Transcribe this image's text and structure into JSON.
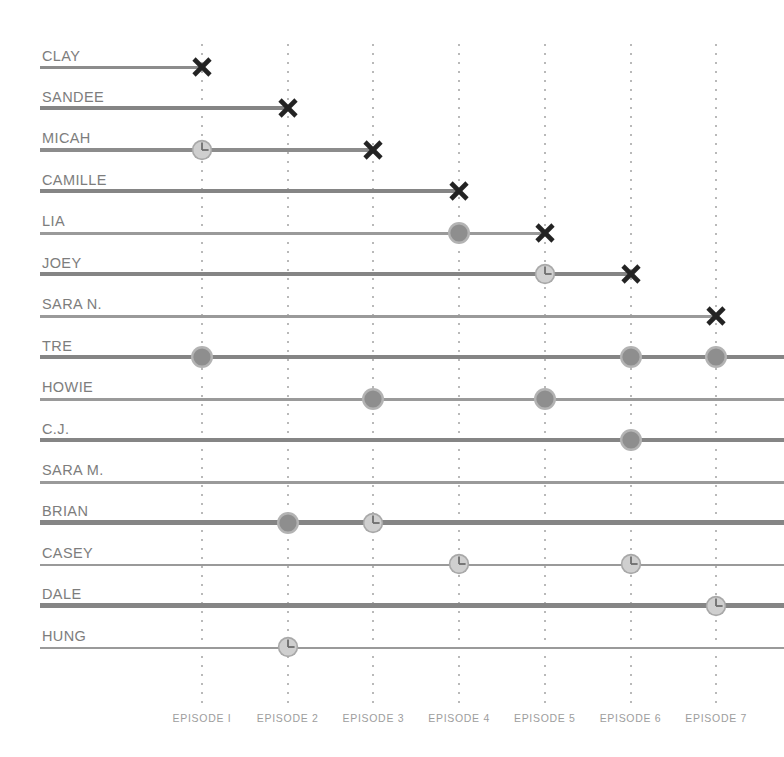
{
  "chart_data": {
    "type": "table",
    "title": "",
    "xlabel": "",
    "ylabel": "",
    "categories": [
      "EPISODE I",
      "EPISODE 2",
      "EPISODE 3",
      "EPISODE 4",
      "EPISODE 5",
      "EPISODE 6",
      "EPISODE 7"
    ],
    "legend": [],
    "grid": true,
    "marker_types": {
      "x": "eliminated-x-marker",
      "circle": "dark-circle-marker",
      "clock": "clock-circle-marker"
    },
    "colors": {
      "line": "#8c8c8c",
      "label": "#7d7d7d",
      "axis_label": "#9d9d9d",
      "gridline": "#b9b9b9",
      "marker_x": "#232323",
      "marker_circle_fill": "#8e8e8e",
      "marker_circle_ring": "#b3b3b3",
      "marker_clock_fill": "#cfcfcf",
      "marker_clock_ring": "#a8a8a8",
      "marker_clock_hands": "#6e6e6e"
    },
    "series": [
      {
        "name": "CLAY",
        "end_episode": 1,
        "line_weight": "med",
        "markers": [
          {
            "episode": 1,
            "type": "x"
          }
        ]
      },
      {
        "name": "SANDEE",
        "end_episode": 2,
        "line_weight": "thick",
        "markers": [
          {
            "episode": 2,
            "type": "x"
          }
        ]
      },
      {
        "name": "MICAH",
        "end_episode": 3,
        "line_weight": "med",
        "markers": [
          {
            "episode": 1,
            "type": "clock"
          },
          {
            "episode": 3,
            "type": "x"
          }
        ]
      },
      {
        "name": "CAMILLE",
        "end_episode": 4,
        "line_weight": "thick",
        "markers": [
          {
            "episode": 4,
            "type": "x"
          }
        ]
      },
      {
        "name": "LIA",
        "end_episode": 5,
        "line_weight": "thin",
        "markers": [
          {
            "episode": 4,
            "type": "circle"
          },
          {
            "episode": 5,
            "type": "x"
          }
        ]
      },
      {
        "name": "JOEY",
        "end_episode": 6,
        "line_weight": "thick",
        "markers": [
          {
            "episode": 5,
            "type": "clock"
          },
          {
            "episode": 6,
            "type": "x"
          }
        ]
      },
      {
        "name": "SARA N.",
        "end_episode": 7,
        "line_weight": "thin",
        "markers": [
          {
            "episode": 7,
            "type": "x"
          }
        ]
      },
      {
        "name": "TRE",
        "end_episode": 8,
        "line_weight": "thick",
        "markers": [
          {
            "episode": 1,
            "type": "circle"
          },
          {
            "episode": 6,
            "type": "circle"
          },
          {
            "episode": 7,
            "type": "circle"
          }
        ]
      },
      {
        "name": "HOWIE",
        "end_episode": 8,
        "line_weight": "thin",
        "markers": [
          {
            "episode": 3,
            "type": "circle"
          },
          {
            "episode": 5,
            "type": "circle"
          }
        ]
      },
      {
        "name": "C.J.",
        "end_episode": 8,
        "line_weight": "thick",
        "markers": [
          {
            "episode": 6,
            "type": "circle"
          }
        ]
      },
      {
        "name": "SARA M.",
        "end_episode": 8,
        "line_weight": "thin",
        "markers": []
      },
      {
        "name": "BRIAN",
        "end_episode": 8,
        "line_weight": "thick",
        "markers": [
          {
            "episode": 2,
            "type": "circle"
          },
          {
            "episode": 3,
            "type": "clock"
          }
        ]
      },
      {
        "name": "CASEY",
        "end_episode": 8,
        "line_weight": "thin",
        "markers": [
          {
            "episode": 4,
            "type": "clock"
          },
          {
            "episode": 6,
            "type": "clock"
          }
        ]
      },
      {
        "name": "DALE",
        "end_episode": 8,
        "line_weight": "thick",
        "markers": [
          {
            "episode": 7,
            "type": "clock"
          }
        ]
      },
      {
        "name": "HUNG",
        "end_episode": 8,
        "line_weight": "thin",
        "markers": [
          {
            "episode": 2,
            "type": "clock"
          }
        ]
      }
    ]
  },
  "layout": {
    "row_first_baseline": 65,
    "row_step": 41.45,
    "grid_x_first": 202,
    "grid_x_step": 85.7,
    "line_left": 40,
    "line_right_edge": 784
  }
}
